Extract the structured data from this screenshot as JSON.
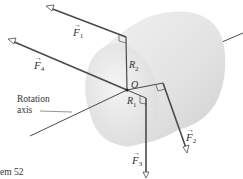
{
  "figure": {
    "caption_fragment": "em 52",
    "axis_label_line1": "Rotation",
    "axis_label_line2": "axis",
    "origin_label": "O",
    "radius_labels": [
      {
        "base": "R",
        "sub": "2"
      },
      {
        "base": "R",
        "sub": "1"
      }
    ],
    "force_labels": [
      {
        "base": "F",
        "sub": "1"
      },
      {
        "base": "F",
        "sub": "2"
      },
      {
        "base": "F",
        "sub": "3"
      },
      {
        "base": "F",
        "sub": "4"
      }
    ],
    "vector_arrow_glyph": "→"
  },
  "colors": {
    "line": "#4a4a4a",
    "cylinder_face": "#ececec",
    "cylinder_body": "#e0e0e0",
    "text": "#333333"
  }
}
